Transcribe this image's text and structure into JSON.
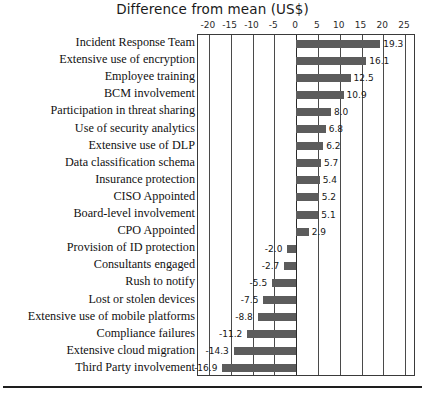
{
  "chart_data": {
    "type": "bar",
    "orientation": "horizontal",
    "title": "Difference from mean (US$)",
    "xlabel": "",
    "ylabel": "",
    "xlim": [
      -22.5,
      27.5
    ],
    "grid": true,
    "legend": false,
    "xticks": [
      -20,
      -15,
      -10,
      -5,
      0,
      5,
      10,
      15,
      20,
      25
    ],
    "xtick_labels": [
      "-20",
      "-15",
      "-10",
      "-5",
      "0",
      "5",
      "10",
      "15",
      "20",
      "25"
    ],
    "bar_color": "#5c5c5c",
    "categories": [
      "Incident Response Team",
      "Extensive use of encryption",
      "Employee training",
      "BCM involvement",
      "Participation in threat sharing",
      "Use of security analytics",
      "Extensive use of DLP",
      "Data classification schema",
      "Insurance protection",
      "CISO Appointed",
      "Board-level involvement",
      "CPO Appointed",
      "Provision of ID protection",
      "Consultants engaged",
      "Rush to notify",
      "Lost or stolen devices",
      "Extensive use of mobile platforms",
      "Compliance failures",
      "Extensive cloud migration",
      "Third Party involvement"
    ],
    "values": [
      19.3,
      16.1,
      12.5,
      10.9,
      8.0,
      6.8,
      6.2,
      5.7,
      5.4,
      5.2,
      5.1,
      2.9,
      -2.0,
      -2.7,
      -5.5,
      -7.5,
      -8.8,
      -11.2,
      -14.3,
      -16.9
    ],
    "value_labels": [
      "19.3",
      "16.1",
      "12.5",
      "10.9",
      "8.0",
      "6.8",
      "6.2",
      "5.7",
      "5.4",
      "5.2",
      "5.1",
      "2.9",
      "-2.0",
      "-2.7",
      "-5.5",
      "-7.5",
      "-8.8",
      "-11.2",
      "-14.3",
      "-16.9"
    ]
  }
}
